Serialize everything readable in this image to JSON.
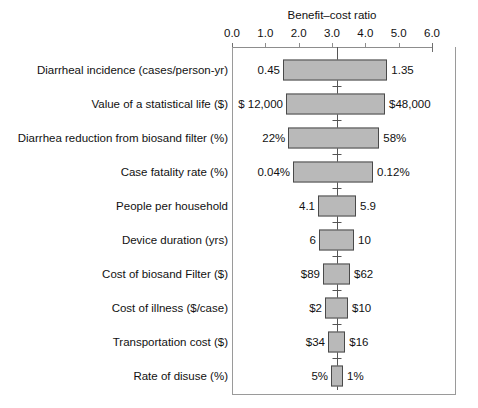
{
  "chart_data": {
    "type": "bar",
    "title": "Benefit–cost ratio",
    "xlabel": "Benefit–cost ratio",
    "ylabel": "",
    "xlim": [
      0.0,
      6.0
    ],
    "xticks": [
      "0.0",
      "1.0",
      "2.0",
      "3.0",
      "4.0",
      "5.0",
      "6.0"
    ],
    "xtick_values": [
      0.0,
      1.0,
      2.0,
      3.0,
      4.0,
      5.0,
      6.0
    ],
    "grid": false,
    "legend": "none",
    "baseline": 3.15,
    "orientation": "horizontal",
    "style": "tornado",
    "categories": [
      "Diarrheal incidence (cases/person-yr)",
      "Value of a statistical life ($)",
      "Diarrhea reduction from biosand filter (%)",
      "Case fatality rate (%)",
      "People per household",
      "Device duration (yrs)",
      "Cost of biosand Filter ($)",
      "Cost of illness ($/case)",
      "Transportation cost ($)",
      "Rate of disuse (%)"
    ],
    "bars": [
      {
        "label": "Diarrheal incidence (cases/person-yr)",
        "low_value_label": "0.45",
        "high_value_label": "1.35",
        "low_ratio": 1.53,
        "high_ratio": 4.66
      },
      {
        "label": "Value of a statistical life ($)",
        "low_value_label": "$ 12,000",
        "high_value_label": "$48,000",
        "low_ratio": 1.62,
        "high_ratio": 4.59
      },
      {
        "label": "Diarrhea reduction from biosand filter (%)",
        "low_value_label": "22%",
        "high_value_label": "58%",
        "low_ratio": 1.69,
        "high_ratio": 4.42
      },
      {
        "label": "Case fatality rate (%)",
        "low_value_label": "0.04%",
        "high_value_label": "0.12%",
        "low_ratio": 1.83,
        "high_ratio": 4.23
      },
      {
        "label": "People per household",
        "low_value_label": "4.1",
        "high_value_label": "5.9",
        "low_ratio": 2.58,
        "high_ratio": 3.72
      },
      {
        "label": "Device duration (yrs)",
        "low_value_label": "6",
        "high_value_label": "10",
        "low_ratio": 2.61,
        "high_ratio": 3.66
      },
      {
        "label": "Cost of biosand Filter ($)",
        "low_value_label": "$89",
        "high_value_label": "$62",
        "low_ratio": 2.73,
        "high_ratio": 3.54
      },
      {
        "label": "Cost of illness ($/case)",
        "low_value_label": "$2",
        "high_value_label": "$10",
        "low_ratio": 2.79,
        "high_ratio": 3.48
      },
      {
        "label": "Transportation cost ($)",
        "low_value_label": "$34",
        "high_value_label": "$16",
        "low_ratio": 2.88,
        "high_ratio": 3.4
      },
      {
        "label": "Rate of disuse (%)",
        "low_value_label": "5%",
        "high_value_label": "1%",
        "low_ratio": 2.97,
        "high_ratio": 3.33
      }
    ],
    "colors": {
      "bar_fill": "#b9b9b9",
      "bar_stroke": "#4a4a4a",
      "axis": "#8d8d8d",
      "frame": "#9a9a9a",
      "baseline": "#555555",
      "text": "#111111",
      "background": "#ffffff"
    }
  }
}
